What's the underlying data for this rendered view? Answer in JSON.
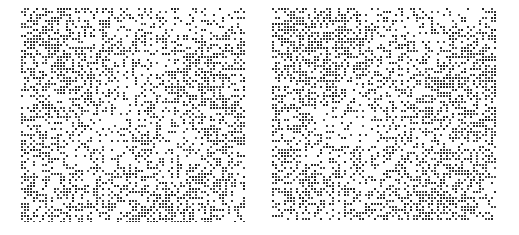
{
  "figure": {
    "width": 519,
    "height": 235,
    "background_color": "#ffffff",
    "title": "",
    "panel_count": 2,
    "layout": "1x2 side-by-side"
  },
  "chart_data": [
    {
      "type": "heatmap",
      "subtype": "spy-plot-binary-matrix",
      "name": "left-matrix",
      "title": "",
      "subtitle": "",
      "xlabel": "",
      "ylabel": "",
      "tick_labels_x": [],
      "tick_labels_y": [],
      "legend": [],
      "annotations": [],
      "grid": false,
      "axes_visible": false,
      "colors": {
        "background": "#ffffff",
        "filled_cell": "#2b2b2b",
        "empty_cell": "#ffffff"
      },
      "rows": 72,
      "cols": 75,
      "cell_size_px": 2,
      "cell_pitch_px": 3,
      "fill_fraction": 0.42,
      "values_note": "binary occupancy matrix, 1 = dark square, 0 = white",
      "seed": 20240117
    },
    {
      "type": "heatmap",
      "subtype": "spy-plot-binary-matrix",
      "name": "right-matrix",
      "title": "",
      "subtitle": "",
      "xlabel": "",
      "ylabel": "",
      "tick_labels_x": [],
      "tick_labels_y": [],
      "legend": [],
      "annotations": [],
      "grid": false,
      "axes_visible": false,
      "colors": {
        "background": "#ffffff",
        "filled_cell": "#2b2b2b",
        "empty_cell": "#ffffff"
      },
      "rows": 71,
      "cols": 75,
      "cell_size_px": 2,
      "cell_pitch_px": 3,
      "fill_fraction": 0.44,
      "values_note": "binary occupancy matrix, 1 = dark square, 0 = white",
      "seed": 99811273
    }
  ]
}
